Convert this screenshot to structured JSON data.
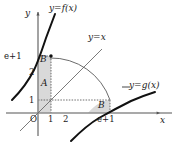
{
  "figure": {
    "kind": "math-graph",
    "background_color": "#ffffff",
    "ink_color": "#1a1a1a",
    "shade_color": "#d9d9d9"
  },
  "axes": {
    "x_axis_label": "x",
    "y_axis_label": "y",
    "origin_label": "O",
    "x_ticks": [
      {
        "label": "1"
      },
      {
        "label": "2"
      },
      {
        "label": "e+1"
      }
    ],
    "y_ticks": [
      {
        "label": "1"
      },
      {
        "label": "2"
      },
      {
        "label": "e+1"
      }
    ]
  },
  "curves": [
    {
      "name": "f-curve",
      "label": "y=f(x)"
    },
    {
      "name": "identity-line",
      "label": "y=x"
    },
    {
      "name": "g-curve",
      "label": "y=g(x)"
    }
  ],
  "regions": [
    {
      "name": "region-a",
      "label": "A"
    },
    {
      "name": "region-b-upper",
      "label": "B"
    },
    {
      "name": "region-b-lower",
      "label": "B"
    }
  ]
}
